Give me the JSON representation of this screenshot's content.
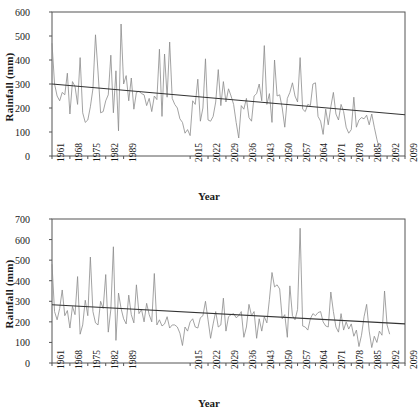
{
  "figure": {
    "panels": [
      "top",
      "bottom"
    ],
    "line_color": "#8c8c8c",
    "trend_color": "#333333",
    "axis_color": "#555555"
  },
  "chart_data": [
    {
      "type": "line",
      "panel": "top",
      "title": "",
      "xlabel": "Year",
      "ylabel": "Rainfall (mm)",
      "ylim": [
        0,
        600
      ],
      "yticks": [
        0,
        100,
        200,
        300,
        400,
        500,
        600
      ],
      "xlim": [
        1961,
        2099
      ],
      "xticks": [
        1961,
        1968,
        1975,
        1982,
        1989,
        2015,
        2022,
        2029,
        2036,
        2043,
        2050,
        2057,
        2064,
        2071,
        2078,
        2085,
        2092,
        2099
      ],
      "grid": false,
      "legend": null,
      "trendline": {
        "name": "Linear trend",
        "x": [
          1961,
          2099
        ],
        "y": [
          300,
          172
        ]
      },
      "series": [
        {
          "name": "Rainfall",
          "x": [
            1961,
            1962,
            1963,
            1964,
            1965,
            1966,
            1967,
            1968,
            1969,
            1970,
            1971,
            1972,
            1973,
            1974,
            1975,
            1976,
            1977,
            1978,
            1979,
            1980,
            1981,
            1982,
            1983,
            1984,
            1985,
            1986,
            1987,
            1988,
            1989,
            1990,
            1991,
            1992,
            1993,
            1994,
            1995,
            1996,
            1997,
            1998,
            1999,
            2000,
            2001,
            2002,
            2003,
            2004,
            2005,
            2006,
            2007,
            2008,
            2009,
            2010,
            2011,
            2012,
            2013,
            2014,
            2015,
            2016,
            2017,
            2018,
            2019,
            2020,
            2021,
            2022,
            2023,
            2024,
            2025,
            2026,
            2027,
            2028,
            2029,
            2030,
            2031,
            2032,
            2033,
            2034,
            2035,
            2036,
            2037,
            2038,
            2039,
            2040,
            2041,
            2042,
            2043,
            2044,
            2045,
            2046,
            2047,
            2048,
            2049,
            2050,
            2051,
            2052,
            2053,
            2054,
            2055,
            2056,
            2057,
            2058,
            2059,
            2060,
            2061,
            2062,
            2063,
            2064,
            2065,
            2066,
            2067,
            2068,
            2069,
            2070,
            2071,
            2072,
            2073,
            2074,
            2075,
            2076,
            2077,
            2078,
            2079,
            2080,
            2081,
            2082,
            2083,
            2084,
            2085,
            2086,
            2087,
            2088,
            2089,
            2090,
            2091,
            2092,
            2093,
            2094,
            2095,
            2096,
            2097,
            2098,
            2099
          ],
          "values": [
            470,
            300,
            250,
            230,
            265,
            255,
            345,
            175,
            310,
            290,
            215,
            410,
            180,
            140,
            150,
            205,
            280,
            505,
            350,
            180,
            185,
            230,
            255,
            420,
            180,
            355,
            105,
            550,
            300,
            335,
            230,
            325,
            195,
            265,
            270,
            260,
            255,
            210,
            240,
            185,
            250,
            235,
            445,
            165,
            425,
            245,
            475,
            240,
            215,
            200,
            155,
            140,
            95,
            110,
            85,
            230,
            215,
            320,
            145,
            200,
            405,
            150,
            145,
            165,
            225,
            360,
            210,
            310,
            225,
            280,
            250,
            215,
            140,
            75,
            210,
            195,
            240,
            160,
            145,
            250,
            260,
            300,
            230,
            460,
            215,
            260,
            140,
            400,
            250,
            255,
            200,
            120,
            240,
            265,
            305,
            250,
            225,
            410,
            195,
            185,
            215,
            210,
            300,
            305,
            165,
            145,
            90,
            195,
            130,
            205,
            265,
            175,
            150,
            215,
            185,
            120,
            95,
            110,
            245,
            120,
            150,
            160,
            155,
            170,
            130,
            175,
            120,
            70,
            30
          ]
        }
      ]
    },
    {
      "type": "line",
      "panel": "bottom",
      "title": "",
      "xlabel": "Year",
      "ylabel": "Rainfall (mm)",
      "ylim": [
        0,
        700
      ],
      "yticks": [
        0,
        100,
        200,
        300,
        400,
        500,
        600,
        700
      ],
      "xlim": [
        1961,
        2099
      ],
      "xticks": [
        1961,
        1968,
        1975,
        1982,
        1989,
        2015,
        2022,
        2029,
        2036,
        2043,
        2050,
        2057,
        2064,
        2071,
        2078,
        2085,
        2092,
        2099
      ],
      "grid": false,
      "legend": null,
      "trendline": {
        "name": "Linear trend",
        "x": [
          1961,
          2099
        ],
        "y": [
          283,
          190
        ]
      },
      "series": [
        {
          "name": "Rainfall",
          "x": [
            1961,
            1962,
            1963,
            1964,
            1965,
            1966,
            1967,
            1968,
            1969,
            1970,
            1971,
            1972,
            1973,
            1974,
            1975,
            1976,
            1977,
            1978,
            1979,
            1980,
            1981,
            1982,
            1983,
            1984,
            1985,
            1986,
            1987,
            1988,
            1989,
            1990,
            1991,
            1992,
            1993,
            1994,
            1995,
            1996,
            1997,
            1998,
            1999,
            2000,
            2001,
            2002,
            2003,
            2004,
            2005,
            2006,
            2007,
            2008,
            2009,
            2010,
            2011,
            2012,
            2013,
            2014,
            2015,
            2016,
            2017,
            2018,
            2019,
            2020,
            2021,
            2022,
            2023,
            2024,
            2025,
            2026,
            2027,
            2028,
            2029,
            2030,
            2031,
            2032,
            2033,
            2034,
            2035,
            2036,
            2037,
            2038,
            2039,
            2040,
            2041,
            2042,
            2043,
            2044,
            2045,
            2046,
            2047,
            2048,
            2049,
            2050,
            2051,
            2052,
            2053,
            2054,
            2055,
            2056,
            2057,
            2058,
            2059,
            2060,
            2061,
            2062,
            2063,
            2064,
            2065,
            2066,
            2067,
            2068,
            2069,
            2070,
            2071,
            2072,
            2073,
            2074,
            2075,
            2076,
            2077,
            2078,
            2079,
            2080,
            2081,
            2082,
            2083,
            2084,
            2085,
            2086,
            2087,
            2088,
            2089,
            2090,
            2091,
            2092,
            2093,
            2094,
            2095,
            2096,
            2097,
            2098,
            2099
          ],
          "values": [
            480,
            250,
            210,
            265,
            355,
            230,
            255,
            170,
            275,
            235,
            420,
            140,
            185,
            305,
            230,
            515,
            250,
            195,
            185,
            300,
            265,
            430,
            150,
            260,
            565,
            110,
            340,
            265,
            215,
            190,
            330,
            235,
            195,
            380,
            240,
            260,
            200,
            290,
            235,
            200,
            435,
            185,
            210,
            180,
            190,
            225,
            170,
            185,
            185,
            175,
            145,
            85,
            175,
            155,
            200,
            215,
            175,
            170,
            220,
            230,
            300,
            210,
            120,
            190,
            250,
            175,
            185,
            315,
            155,
            225,
            235,
            240,
            220,
            230,
            250,
            125,
            175,
            285,
            230,
            250,
            120,
            215,
            155,
            225,
            195,
            310,
            440,
            370,
            380,
            360,
            215,
            235,
            125,
            375,
            230,
            210,
            260,
            655,
            180,
            175,
            160,
            215,
            240,
            230,
            245,
            250,
            200,
            180,
            175,
            345,
            250,
            175,
            150,
            240,
            160,
            200,
            165,
            190,
            130,
            160,
            80,
            135,
            225,
            285,
            155,
            75,
            130,
            100,
            155,
            135,
            350,
            185,
            140
          ]
        }
      ]
    }
  ]
}
